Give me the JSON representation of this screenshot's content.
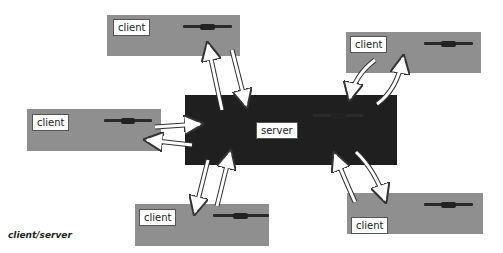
{
  "diagram": {
    "caption": "client/server",
    "server": {
      "label": "server",
      "color": "#1f1f1f"
    },
    "clients": [
      {
        "id": "client-top",
        "label": "client"
      },
      {
        "id": "client-left",
        "label": "client"
      },
      {
        "id": "client-top-right",
        "label": "client"
      },
      {
        "id": "client-bottom",
        "label": "client"
      },
      {
        "id": "client-bottom-right",
        "label": "client"
      }
    ],
    "client_color": "#8f8f8f",
    "arrow_style": "white hollow arrows, bidirectional pairs"
  }
}
